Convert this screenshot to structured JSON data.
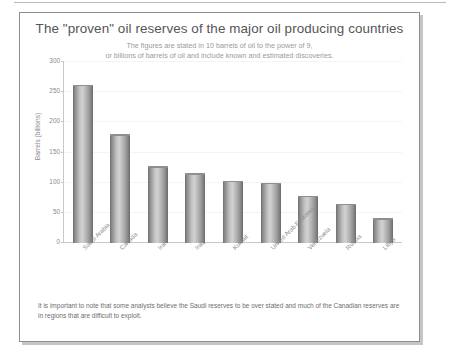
{
  "page": {
    "top_rule": true
  },
  "chart_data": {
    "type": "bar",
    "title": "The \"proven\" oil reserves of the major oil producing countries",
    "subtitle_lines": [
      "The figures are stated in 10 barrels of oil to the power of 9,",
      "or billions of barrels of oil and include known and estimated discoveries."
    ],
    "xlabel": "",
    "ylabel": "Barrels (billions)",
    "ylim": [
      0,
      300
    ],
    "yticks": [
      0,
      50,
      100,
      150,
      200,
      250,
      300
    ],
    "grid": true,
    "legend": null,
    "categories": [
      "Saudi Arabia",
      "Canada",
      "Iran",
      "Iraq",
      "Kuwait",
      "United Arab Emirates",
      "Venezuela",
      "Russia",
      "Libya"
    ],
    "values": [
      262,
      180,
      127,
      116,
      103,
      100,
      78,
      65,
      41
    ],
    "bar_color": "#b4b4b4",
    "bar_edge_color": "#6f6f6f"
  },
  "caption": {
    "text": "It is important to note that some analysts believe the Saudi reserves to be over stated and much of the Canadian reserves are in regions that are difficult to exploit."
  }
}
